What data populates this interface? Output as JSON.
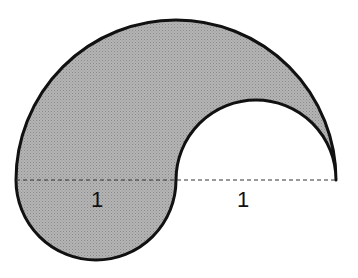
{
  "figure": {
    "fill_color": "#a9a9a9",
    "stroke_color": "#111111",
    "labels": {
      "left_radius": "1",
      "right_radius": "1"
    }
  }
}
